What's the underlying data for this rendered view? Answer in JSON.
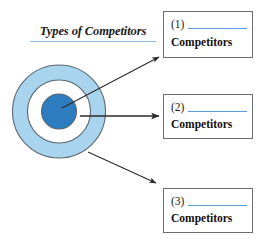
{
  "diagram": {
    "title": "Types of Competitors",
    "colors": {
      "outer_ring_fill": "#a8d4ed",
      "middle_ring_fill": "#ffffff",
      "inner_circle_fill": "#2e7cc0",
      "circle_stroke": "#5b6670",
      "title_rule": "#8fb8d8",
      "blank_line": "#5b9bd5",
      "box_border": "#6e6e6e",
      "arrow": "#2b2b2b"
    },
    "circles": [
      {
        "name": "outer-ring",
        "cx": 59,
        "cy": 111.5,
        "r": 46.5
      },
      {
        "name": "middle-ring",
        "cx": 59,
        "cy": 111.5,
        "r": 31.5
      },
      {
        "name": "inner-circle",
        "cx": 59,
        "cy": 111.5,
        "r": 17.5
      }
    ],
    "arrows": [
      {
        "name": "arrow-to-box-1",
        "x1": 62,
        "y1": 108,
        "x2": 160,
        "y2": 57
      },
      {
        "name": "arrow-to-box-2",
        "x1": 80,
        "y1": 116,
        "x2": 160,
        "y2": 116
      },
      {
        "name": "arrow-to-box-3",
        "x1": 88,
        "y1": 152,
        "x2": 157,
        "y2": 184
      }
    ]
  },
  "answer_boxes": [
    {
      "number": "(1)",
      "label": "Competitors"
    },
    {
      "number": "(2)",
      "label": "Competitors"
    },
    {
      "number": "(3)",
      "label": "Competitors"
    }
  ]
}
